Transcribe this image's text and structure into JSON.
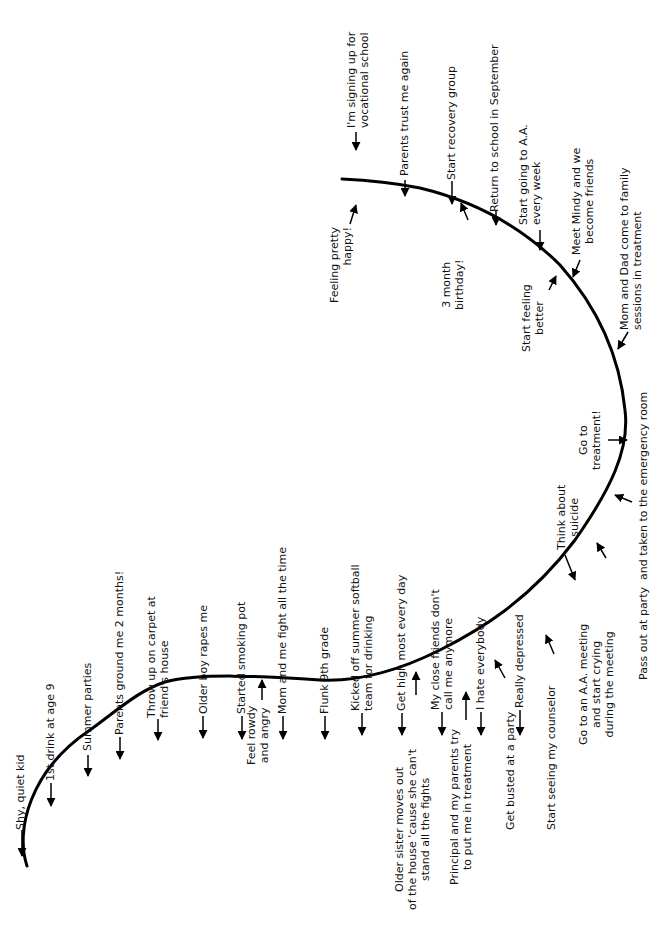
{
  "diagram": {
    "orientation": "rotated-90-ccw",
    "curve_color": "#000000",
    "curve_description": "Relapse/recovery curve: starts low at left, rises to a plateau, descends into a trough at the right, then rises again toward the top",
    "events_above": [
      {
        "id": "shy",
        "text": "Shy, quiet kid"
      },
      {
        "id": "first-drink",
        "text": "1st drink at age 9"
      },
      {
        "id": "summer-parties",
        "text": "Summer parties"
      },
      {
        "id": "grounded",
        "text": "Parents ground me 2 months!"
      },
      {
        "id": "throw-up",
        "text": "Throw up on carpet at\nfriend's house"
      },
      {
        "id": "older-boy",
        "text": "Older boy rapes me"
      },
      {
        "id": "smoking-pot",
        "text": "Started smoking pot"
      },
      {
        "id": "mom-fight",
        "text": "Mom and me fight all the time"
      },
      {
        "id": "flunk",
        "text": "Flunk 9th grade"
      },
      {
        "id": "softball",
        "text": "Kicked off summer softball\nteam for drinking"
      },
      {
        "id": "get-high",
        "text": "Get high most every day"
      },
      {
        "id": "friends",
        "text": "My close friends don't\ncall me anymore"
      },
      {
        "id": "hate",
        "text": "I hate everybody"
      },
      {
        "id": "depressed",
        "text": "Really depressed"
      },
      {
        "id": "suicide",
        "text": "Think about\nsuicide"
      },
      {
        "id": "treatment",
        "text": "Go to\ntreatment!"
      },
      {
        "id": "feeling-better",
        "text": "Start feeling\nbetter"
      },
      {
        "id": "three-month",
        "text": "3 month\nbirthday!"
      },
      {
        "id": "happy",
        "text": "Feeling pretty\nhappy!"
      }
    ],
    "events_below": [
      {
        "id": "rowdy",
        "text": "Feel rowdy\nand angry"
      },
      {
        "id": "sister",
        "text": "Older sister moves out\nof the house 'cause she can't\nstand all the fights"
      },
      {
        "id": "principal",
        "text": "Principal and my parents try\nto put me in treatment"
      },
      {
        "id": "busted",
        "text": "Get busted at a party"
      },
      {
        "id": "counselor",
        "text": "Start seeing my counselor"
      },
      {
        "id": "aa-meeting",
        "text": "Go to an A.A. meeting\nand start crying\nduring the meeting"
      },
      {
        "id": "pass-out",
        "text": "Pass out at party  and taken to the emergency room"
      },
      {
        "id": "family-sessions",
        "text": "Mom and Dad come to family\nsessions in treatment"
      },
      {
        "id": "mindy",
        "text": "Meet Mindy and we\nbecome friends"
      },
      {
        "id": "aa-weekly",
        "text": "Start going to A.A.\nevery week"
      },
      {
        "id": "school",
        "text": "Return to school in September"
      },
      {
        "id": "recovery-group",
        "text": "Start recovery group"
      },
      {
        "id": "trust",
        "text": "Parents trust me again"
      },
      {
        "id": "vocational",
        "text": "I'm signing up for\nvocational school"
      }
    ]
  }
}
